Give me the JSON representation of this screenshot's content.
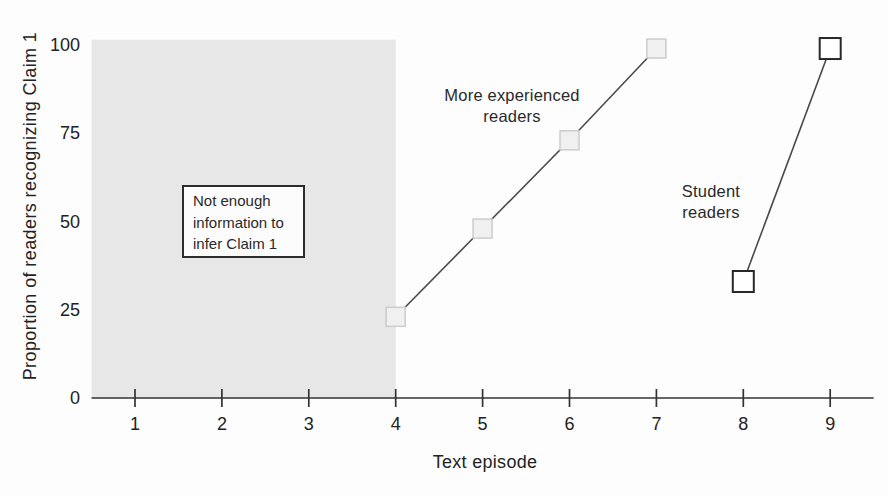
{
  "chart_data": {
    "type": "line",
    "title": "",
    "xlabel": "Text episode",
    "ylabel": "Proportion of readers recognizing Claim 1",
    "x_ticks": [
      1,
      2,
      3,
      4,
      5,
      6,
      7,
      8,
      9
    ],
    "y_ticks": [
      0,
      25,
      50,
      75,
      100
    ],
    "xlim": [
      0.5,
      9.5
    ],
    "ylim": [
      0,
      101.5
    ],
    "grid": false,
    "legend_position": "inline-annotations",
    "series": [
      {
        "name": "More experienced readers",
        "label_lines": [
          "More experienced",
          "readers"
        ],
        "x": [
          4,
          5,
          6,
          7
        ],
        "values": [
          23,
          48,
          73,
          99
        ],
        "marker": "square",
        "marker_size": 19,
        "marker_fill": "#f0f0f0",
        "marker_stroke": "#cccccc"
      },
      {
        "name": "Student readers",
        "label_lines": [
          "Student",
          "readers"
        ],
        "x": [
          8,
          9
        ],
        "values": [
          33,
          99
        ],
        "marker": "square",
        "marker_size": 21,
        "marker_fill": "#ffffff",
        "marker_stroke": "#282828"
      }
    ],
    "shaded_region": {
      "x_from": 0.5,
      "x_to": 4,
      "y_from": 0,
      "y_to": 101.5,
      "fill": "#e7e7e7"
    },
    "annotation_box": {
      "lines": [
        "Not enough",
        "information to",
        "infer Claim 1"
      ]
    }
  },
  "colors": {
    "line": "#4a4a4a",
    "axis": "#333333",
    "tick_text": "#222222",
    "background": "#fdfdfd"
  }
}
